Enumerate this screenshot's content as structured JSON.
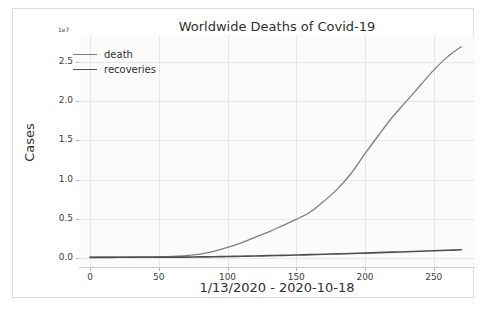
{
  "chart_data": {
    "type": "line",
    "title": "Worldwide Deaths of Covid-19",
    "xlabel": "1/13/2020 - 2020-10-18",
    "ylabel": "Cases",
    "y_offset_label": "1e7",
    "xlim": [
      -8,
      280
    ],
    "ylim": [
      -0.12,
      2.85
    ],
    "xticks": [
      0,
      50,
      100,
      150,
      200,
      250
    ],
    "xtick_labels": [
      "0",
      "50",
      "100",
      "150",
      "200",
      "250"
    ],
    "yticks": [
      0.0,
      0.5,
      1.0,
      1.5,
      2.0,
      2.5
    ],
    "ytick_labels": [
      "0.0",
      "0.5",
      "1.0",
      "1.5",
      "2.0",
      "2.5"
    ],
    "grid": true,
    "legend_position": "upper left",
    "x": [
      0,
      10,
      20,
      30,
      40,
      50,
      60,
      70,
      80,
      90,
      100,
      110,
      120,
      130,
      140,
      150,
      160,
      170,
      180,
      190,
      200,
      210,
      220,
      230,
      240,
      250,
      260,
      270
    ],
    "series": [
      {
        "name": "death",
        "color": "#7f7f7f",
        "linewidth": 1.3,
        "values": [
          0.004,
          0.005,
          0.006,
          0.008,
          0.01,
          0.012,
          0.016,
          0.025,
          0.045,
          0.08,
          0.13,
          0.19,
          0.26,
          0.33,
          0.41,
          0.49,
          0.58,
          0.72,
          0.88,
          1.08,
          1.33,
          1.57,
          1.8,
          2.0,
          2.2,
          2.4,
          2.57,
          2.7
        ]
      },
      {
        "name": "recoveries",
        "color": "#4d4d4d",
        "linewidth": 1.6,
        "values": [
          0.003,
          0.003,
          0.004,
          0.004,
          0.005,
          0.005,
          0.006,
          0.007,
          0.009,
          0.011,
          0.014,
          0.017,
          0.021,
          0.025,
          0.029,
          0.033,
          0.038,
          0.043,
          0.048,
          0.053,
          0.058,
          0.064,
          0.07,
          0.076,
          0.082,
          0.088,
          0.094,
          0.1
        ]
      }
    ]
  },
  "legend": {
    "items": [
      {
        "label": "death"
      },
      {
        "label": "recoveries"
      }
    ]
  },
  "colors": {
    "death": "#7f7f7f",
    "recoveries": "#4d4d4d",
    "grid": "#e3e8ee",
    "axis": "#cfcfcf",
    "plot_background": "#fbfbfb",
    "figure_background": "#ffffff",
    "text": "#2f2f2f"
  }
}
